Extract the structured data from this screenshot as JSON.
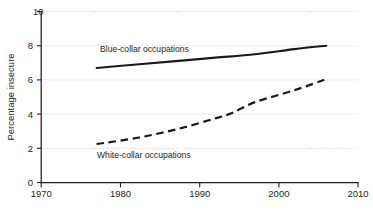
{
  "chart_data": {
    "type": "line",
    "title": "",
    "subtitle": "",
    "xlabel": "",
    "ylabel": "Percentage insecure",
    "xlim": [
      1970,
      2010
    ],
    "ylim": [
      0,
      10
    ],
    "xticks": [
      1970,
      1980,
      1990,
      2000,
      2010
    ],
    "xtick_labels": [
      "1970",
      "1980",
      "1990",
      "2000",
      "2010"
    ],
    "yticks": [
      0,
      2,
      4,
      6,
      8,
      10
    ],
    "ytick_labels": [
      "0",
      "2",
      "4",
      "6",
      "8",
      "10"
    ],
    "grid": "horizontal-dotted",
    "legend_position": "inline-annotations",
    "series": [
      {
        "name": "Blue-collar occupations",
        "style": "solid",
        "color": "#1a1a1a",
        "x": [
          1977,
          1982,
          1987,
          1992,
          1997,
          2002,
          2006
        ],
        "values": [
          6.7,
          6.9,
          7.1,
          7.3,
          7.5,
          7.8,
          8.0
        ]
      },
      {
        "name": "White-collar occupations",
        "style": "dashed",
        "color": "#1a1a1a",
        "x": [
          1977,
          1982,
          1987,
          1992,
          1994,
          1997,
          2002,
          2006
        ],
        "values": [
          2.25,
          2.6,
          3.1,
          3.75,
          4.05,
          4.7,
          5.4,
          6.05
        ]
      }
    ],
    "annotations": [
      {
        "id": "blue-collar-annotation",
        "text": "Blue-collar occupations",
        "x_year": 1977.5,
        "y_value": 8.35
      },
      {
        "id": "white-collar-annotation",
        "text": "White-collar occupations",
        "x_year": 1977.2,
        "y_value": 1.55
      }
    ]
  },
  "axes": {
    "y_title": "Percentage insecure",
    "y_labels": [
      "10",
      "8",
      "6",
      "4",
      "2",
      "0"
    ],
    "x_labels": [
      "1970",
      "1980",
      "1990",
      "2000",
      "2010"
    ]
  },
  "colors": {
    "ink": "#231f20",
    "series": "#1a1a1a",
    "gridline": "#bcbcbc",
    "background": "#ffffff"
  }
}
